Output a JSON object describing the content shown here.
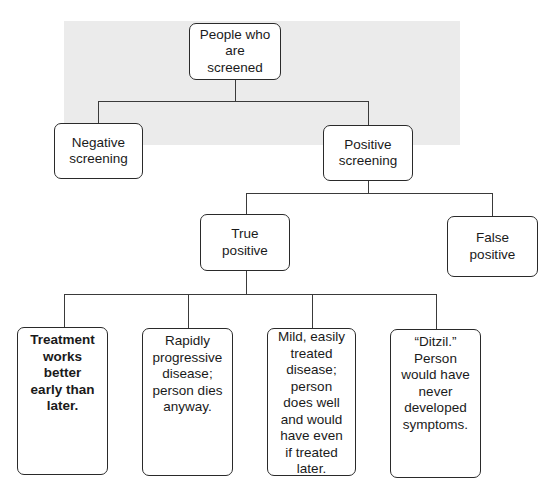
{
  "diagram": {
    "root": {
      "label": "People who\nare\nscreened"
    },
    "level1": [
      {
        "label": "Negative\nscreening"
      },
      {
        "label": "Positive\nscreening"
      }
    ],
    "level2": [
      {
        "label": "True\npositive"
      },
      {
        "label": "False\npositive"
      }
    ],
    "level3": [
      {
        "label": "Treatment\nworks\nbetter\nearly than\nlater.",
        "bold": true
      },
      {
        "label": "Rapidly\nprogressive\ndisease;\nperson dies\nanyway."
      },
      {
        "label": "Mild, easily\ntreated\ndisease;\nperson\ndoes well\nand would\nhave even\nif treated\nlater."
      },
      {
        "label": "“Ditzil.”\nPerson\nwould have\nnever\ndeveloped\nsymptoms."
      }
    ]
  },
  "colors": {
    "line": "#3a3a3a",
    "border": "#2a2a2a",
    "background": "#ffffff",
    "scan_band": "#ebebeb"
  }
}
